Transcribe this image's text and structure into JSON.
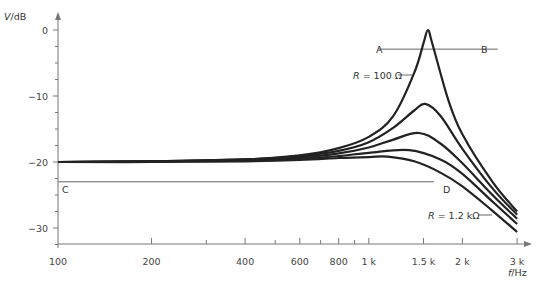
{
  "chart_data": {
    "type": "line",
    "title": "",
    "xlabel": "f/Hz",
    "ylabel": "V/dB",
    "xscale": "log",
    "xlim": [
      100,
      3000
    ],
    "ylim": [
      -33,
      3
    ],
    "x_ticks": [
      {
        "value": 100,
        "label": "100"
      },
      {
        "value": 200,
        "label": "200"
      },
      {
        "value": 400,
        "label": "400"
      },
      {
        "value": 600,
        "label": "600"
      },
      {
        "value": 800,
        "label": "800"
      },
      {
        "value": 1000,
        "label": "1 k"
      },
      {
        "value": 1500,
        "label": "1.5 k"
      },
      {
        "value": 2000,
        "label": "2 k"
      },
      {
        "value": 3000,
        "label": "3 k"
      }
    ],
    "x_minor_ticks": [
      300,
      500,
      700,
      900
    ],
    "y_ticks": [
      {
        "value": 0,
        "label": "0"
      },
      {
        "value": -10,
        "label": "−10"
      },
      {
        "value": -20,
        "label": "−20"
      },
      {
        "value": -30,
        "label": "−30"
      }
    ],
    "y_minor_step": 2.5,
    "grid": false,
    "series": [
      {
        "name": "R = 100 Ω",
        "peak_f": 1550,
        "peak_db": 0.0,
        "q": 7.5,
        "x": [
          100,
          200,
          400,
          600,
          800,
          1000,
          1200,
          1400,
          1500,
          1550,
          1600,
          1800,
          2000,
          2500,
          3000
        ],
        "y": [
          -20,
          -19.9,
          -19.6,
          -19.0,
          -17.9,
          -16.2,
          -13.0,
          -6.5,
          -2.0,
          0.0,
          -2.0,
          -10.5,
          -15.8,
          -23.0,
          -27.5
        ]
      },
      {
        "name": "R (2)",
        "peak_f": 1520,
        "peak_db": -11.2,
        "x": [
          100,
          200,
          400,
          600,
          800,
          1000,
          1200,
          1400,
          1520,
          1700,
          2000,
          2500,
          3000
        ],
        "y": [
          -20,
          -19.9,
          -19.6,
          -19.1,
          -18.3,
          -17.0,
          -14.8,
          -12.2,
          -11.2,
          -13.0,
          -18.0,
          -24.0,
          -28.0
        ]
      },
      {
        "name": "R (3)",
        "peak_f": 1450,
        "peak_db": -15.6,
        "x": [
          100,
          200,
          400,
          600,
          800,
          1000,
          1200,
          1450,
          1700,
          2000,
          2500,
          3000
        ],
        "y": [
          -20,
          -19.9,
          -19.7,
          -19.3,
          -18.7,
          -17.8,
          -16.6,
          -15.6,
          -17.2,
          -20.2,
          -25.0,
          -28.6
        ]
      },
      {
        "name": "R (4)",
        "peak_f": 1350,
        "peak_db": -18.2,
        "x": [
          100,
          200,
          400,
          600,
          800,
          1000,
          1350,
          1700,
          2000,
          2500,
          3000
        ],
        "y": [
          -20,
          -19.9,
          -19.8,
          -19.5,
          -19.1,
          -18.6,
          -18.2,
          -19.6,
          -21.8,
          -26.0,
          -29.4
        ]
      },
      {
        "name": "R = 1.2 kΩ",
        "peak_f": 1150,
        "peak_db": -19.2,
        "x": [
          100,
          200,
          400,
          600,
          800,
          1000,
          1150,
          1400,
          1700,
          2000,
          2500,
          3000
        ],
        "y": [
          -20,
          -20,
          -19.9,
          -19.7,
          -19.4,
          -19.25,
          -19.2,
          -19.9,
          -21.6,
          -23.7,
          -27.4,
          -30.6
        ]
      }
    ],
    "annotations": [
      {
        "type": "hline",
        "label_left": "A",
        "label_right": "B",
        "y_db": -2.9,
        "x_from": 1100,
        "x_to": 2600
      },
      {
        "type": "hline",
        "label_left": "C",
        "label_right": "D",
        "y_db": -23.0,
        "x_from": 100,
        "x_to": 1620
      },
      {
        "type": "label",
        "text_prefix": "R",
        "text": " = 100 Ω",
        "series": 0
      },
      {
        "type": "label",
        "text_prefix": "R",
        "text": " = 1.2 kΩ",
        "series": 4
      }
    ]
  },
  "labels": {
    "y_axis": "V/dB",
    "x_axis": "f/Hz",
    "point_a": "A",
    "point_b": "B",
    "point_c": "C",
    "point_d": "D",
    "r_var": "R",
    "r_high": " = 100 Ω",
    "r_low": " = 1.2 kΩ"
  }
}
